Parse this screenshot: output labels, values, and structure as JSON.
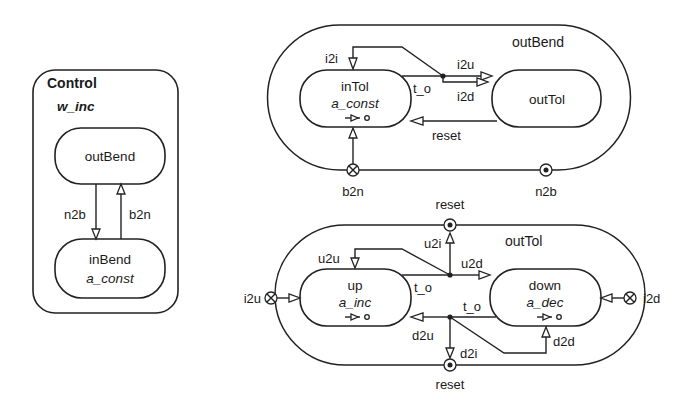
{
  "control": {
    "title": "Control",
    "activity": "w_inc",
    "states": {
      "outBend": {
        "name": "outBend"
      },
      "inBend": {
        "name": "inBend",
        "action": "a_const"
      }
    },
    "transitions": {
      "n2b": "n2b",
      "b2n": "b2n"
    }
  },
  "outBend_region": {
    "label": "outBend",
    "states": {
      "inTol": {
        "name": "inTol",
        "action": "a_const",
        "timer": "->o"
      },
      "outTol": {
        "name": "outTol"
      }
    },
    "transitions": {
      "i2i": "i2i",
      "t_o": "t_o",
      "i2u": "i2u",
      "i2d": "i2d",
      "reset": "reset"
    },
    "entry_point": {
      "label": "b2n",
      "symbol": "entry (⊗)"
    },
    "exit_point": {
      "label": "n2b",
      "symbol": "exit (⊙)"
    }
  },
  "outTol_region": {
    "label": "outTol",
    "states": {
      "up": {
        "name": "up",
        "action": "a_inc",
        "timer": "->o"
      },
      "down": {
        "name": "down",
        "action": "a_dec",
        "timer": "->o"
      }
    },
    "transitions": {
      "u2u": "u2u",
      "u2i": "u2i",
      "u2d": "u2d",
      "t_o_up": "t_o",
      "t_o_down": "t_o",
      "d2u": "d2u",
      "d2i": "d2i",
      "d2d": "d2d"
    },
    "entry_points": {
      "left": "i2u",
      "right": "i2d"
    },
    "exit_points": {
      "top": "reset",
      "bottom": "reset"
    }
  }
}
